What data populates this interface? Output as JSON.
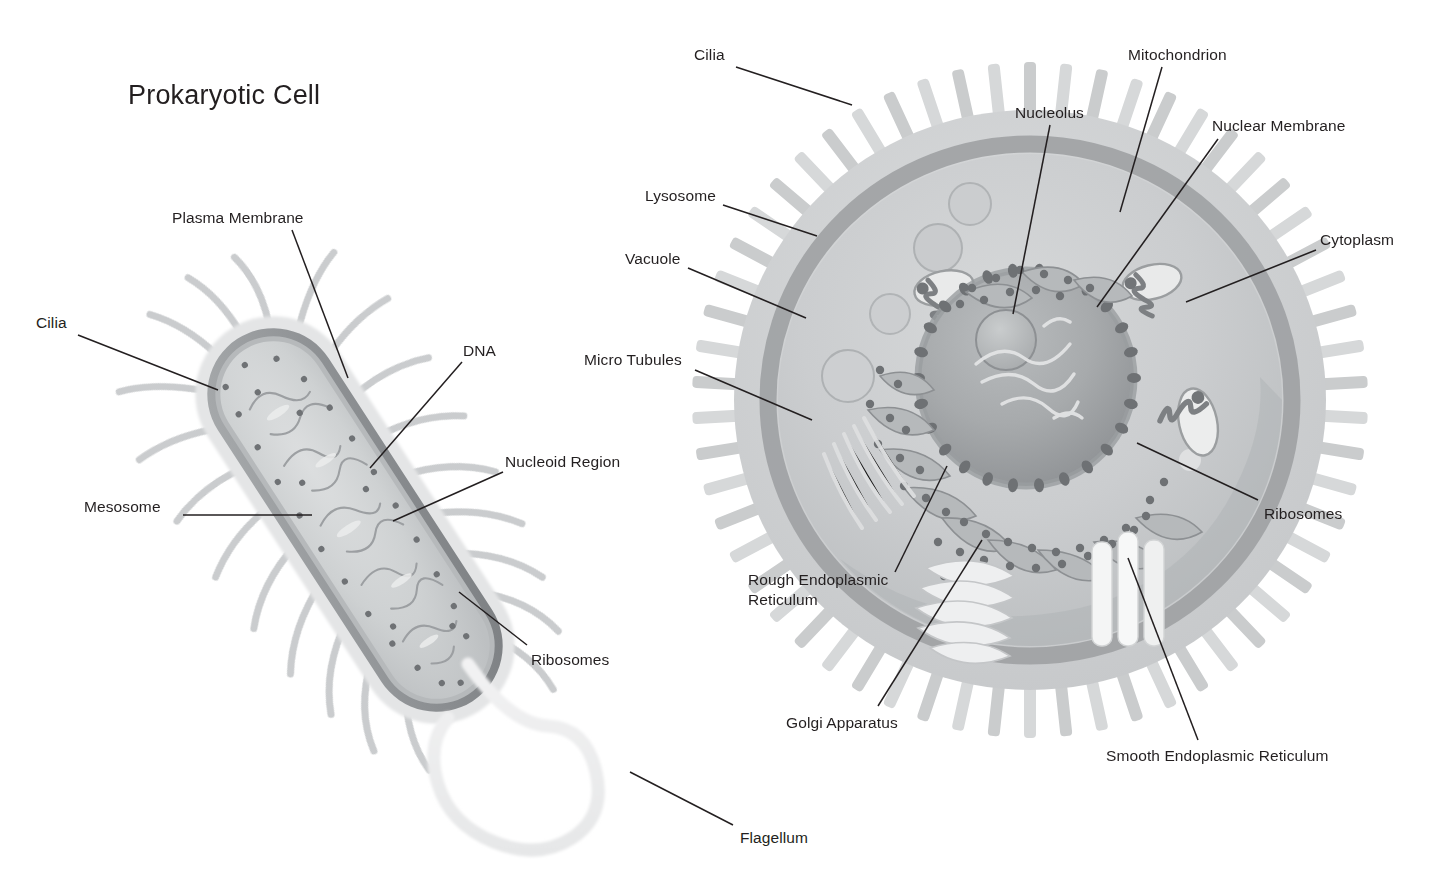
{
  "diagram": {
    "title": "Prokaryotic Cell",
    "background_color": "#ffffff",
    "text_color": "#231f20",
    "leader_line_color": "#231f20"
  },
  "palette": {
    "cilia_light": "#d8d9da",
    "cilia_mid": "#c2c4c6",
    "membrane_outer": "#c9cbcc",
    "membrane_dark": "#8e9194",
    "cytoplasm_light": "#d2d4d5",
    "cytoplasm_mid": "#c0c3c5",
    "nucleus_fill": "#a9acae",
    "nucleolus_fill": "#bdc0c2",
    "organelle_dark": "#7d8083",
    "organelle_light": "#e8e9ea",
    "flagellum": "#ededee"
  },
  "prokaryotic": {
    "name": "Prokaryotic Cell",
    "labels": [
      {
        "id": "plasma-membrane",
        "text": "Plasma Membrane",
        "x": 172,
        "y": 208,
        "line": [
          292,
          230,
          348,
          378
        ]
      },
      {
        "id": "cilia",
        "text": "Cilia",
        "x": 36,
        "y": 313,
        "line": [
          78,
          335,
          218,
          390
        ]
      },
      {
        "id": "dna",
        "text": "DNA",
        "x": 463,
        "y": 341,
        "line": [
          462,
          362,
          370,
          468
        ]
      },
      {
        "id": "nucleoid-region",
        "text": "Nucleoid Region",
        "x": 505,
        "y": 452,
        "line": [
          503,
          472,
          393,
          521
        ]
      },
      {
        "id": "mesosome",
        "text": "Mesosome",
        "x": 84,
        "y": 497,
        "line": [
          183,
          515,
          312,
          515
        ]
      },
      {
        "id": "ribosomes",
        "text": "Ribosomes",
        "x": 531,
        "y": 650,
        "line": [
          527,
          645,
          459,
          592
        ]
      },
      {
        "id": "flagellum",
        "text": "Flagellum",
        "x": 740,
        "y": 828,
        "line": [
          733,
          825,
          630,
          772
        ]
      }
    ]
  },
  "eukaryotic": {
    "name": "Eukaryotic Cell",
    "labels": [
      {
        "id": "cilia",
        "text": "Cilia",
        "x": 694,
        "y": 45,
        "line": [
          736,
          67,
          852,
          105
        ]
      },
      {
        "id": "mitochondrion",
        "text": "Mitochondrion",
        "x": 1128,
        "y": 45,
        "line": [
          1162,
          67,
          1120,
          212
        ]
      },
      {
        "id": "nucleolus",
        "text": "Nucleolus",
        "x": 1015,
        "y": 103,
        "line": [
          1050,
          125,
          1013,
          314
        ]
      },
      {
        "id": "nuclear-membrane",
        "text": "Nuclear Membrane",
        "x": 1212,
        "y": 116,
        "line": [
          1218,
          139,
          1097,
          307
        ]
      },
      {
        "id": "lysosome",
        "text": "Lysosome",
        "x": 645,
        "y": 186,
        "line": [
          723,
          205,
          817,
          236
        ]
      },
      {
        "id": "cytoplasm",
        "text": "Cytoplasm",
        "x": 1320,
        "y": 230,
        "line": [
          1316,
          250,
          1186,
          302
        ]
      },
      {
        "id": "vacuole",
        "text": "Vacuole",
        "x": 625,
        "y": 249,
        "line": [
          688,
          268,
          806,
          318
        ]
      },
      {
        "id": "micro-tubules",
        "text": "Micro Tubules",
        "x": 584,
        "y": 350,
        "line": [
          695,
          370,
          812,
          420
        ]
      },
      {
        "id": "ribosomes",
        "text": "Ribosomes",
        "x": 1264,
        "y": 504,
        "line": [
          1258,
          500,
          1137,
          443
        ]
      },
      {
        "id": "rough-endoplasmic-reticulum",
        "text": "Rough Endoplasmic Reticulum",
        "x": 748,
        "y": 570,
        "line": [
          895,
          572,
          947,
          466
        ]
      },
      {
        "id": "golgi-apparatus",
        "text": "Golgi Apparatus",
        "x": 786,
        "y": 713,
        "line": [
          878,
          706,
          982,
          540
        ]
      },
      {
        "id": "smooth-endoplasmic-reticulum",
        "text": "Smooth Endoplasmic Reticulum",
        "x": 1106,
        "y": 746,
        "line": [
          1198,
          740,
          1128,
          558
        ]
      }
    ]
  }
}
